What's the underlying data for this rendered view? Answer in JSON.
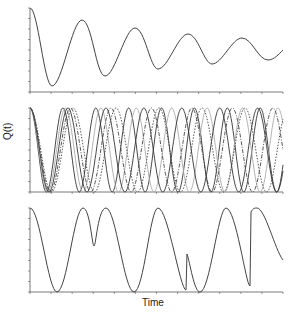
{
  "chart_data": [
    {
      "type": "line",
      "panel": "top",
      "title": "",
      "xlabel": "",
      "ylabel": "",
      "description": "Single damped oscillation decaying toward mid-level",
      "x": [
        0,
        0.09,
        0.21,
        0.3,
        0.42,
        0.51,
        0.63,
        0.72,
        0.84,
        0.94,
        1.0
      ],
      "series": [
        {
          "name": "damped",
          "values": [
            1.0,
            0.07,
            0.86,
            0.19,
            0.76,
            0.27,
            0.69,
            0.33,
            0.64,
            0.38,
            0.5
          ]
        }
      ],
      "ylim": [
        0,
        1
      ],
      "grid": false
    },
    {
      "type": "line",
      "panel": "middle",
      "title": "",
      "xlabel": "",
      "ylabel": "Q(t)",
      "description": "Multiple undamped oscillations with slightly different frequencies (solid, dashed, dotted, grey), all starting at 1",
      "series": [
        {
          "name": "s1",
          "style": "solid",
          "period": 0.52
        },
        {
          "name": "s2",
          "style": "solid-grey",
          "period": 0.56
        },
        {
          "name": "s3",
          "style": "solid",
          "period": 0.6
        },
        {
          "name": "s4",
          "style": "dash-dot",
          "period": 0.64
        },
        {
          "name": "s5",
          "style": "dotted",
          "period": 0.68
        }
      ],
      "ylim": [
        0,
        1
      ],
      "grid": false
    },
    {
      "type": "line",
      "panel": "bottom",
      "title": "",
      "xlabel": "Time",
      "ylabel": "",
      "description": "Oscillation with abrupt phase jumps",
      "x": [
        0,
        0.1,
        0.21,
        0.25,
        0.3,
        0.4,
        0.51,
        0.62,
        0.625,
        0.67,
        0.78,
        0.87,
        0.875,
        0.9,
        1.0
      ],
      "series": [
        {
          "name": "jumps",
          "values": [
            1.0,
            0.0,
            1.0,
            0.55,
            1.0,
            0.0,
            1.0,
            0.02,
            0.45,
            0.0,
            1.0,
            0.05,
            0.95,
            1.0,
            0.5
          ]
        }
      ],
      "ylim": [
        0,
        1
      ],
      "grid": false
    }
  ],
  "labels": {
    "ylabel": "Q(t)",
    "xlabel": "Time"
  }
}
